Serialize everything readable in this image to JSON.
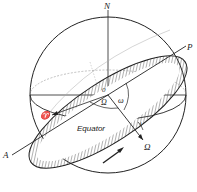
{
  "diagram": {
    "labels": {
      "north": "N",
      "origin": "0",
      "perihelion": "P",
      "aphelion": "A",
      "vernal_equinox": "♈",
      "node_angle": "Ω",
      "perihelion_argument": "ω",
      "inclination": "i",
      "equator": "Equator",
      "node_axis": "Ω"
    },
    "colors": {
      "line": "#222222",
      "faint": "#9a9a9a",
      "hatch": "#555555"
    }
  }
}
